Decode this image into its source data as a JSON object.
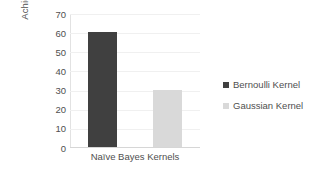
{
  "chart_data": {
    "type": "bar",
    "title": "",
    "subtitle": "",
    "xlabel": "Naïve Bayes Kernels",
    "ylabel_lines": [
      "Maximum Accuracu",
      "Achieved"
    ],
    "ylabel": "Maximum Accuracu Achieved",
    "categories": [
      "Naïve Bayes Kernels"
    ],
    "series": [
      {
        "name": "Bernoulli Kernel",
        "values": [
          60
        ],
        "color": "#404040"
      },
      {
        "name": "Gaussian Kernel",
        "values": [
          30
        ],
        "color": "#d9d9d9"
      }
    ],
    "ylim": [
      0,
      70
    ],
    "ytick_values": [
      70,
      60,
      50,
      40,
      30,
      20,
      10,
      0
    ],
    "ytick_labels": [
      "70",
      "60",
      "50",
      "40",
      "30",
      "20",
      "10",
      "0"
    ],
    "ytick_step": 10,
    "grid": true,
    "grid_axis": "y",
    "legend_position": "right",
    "legend": [
      {
        "label": "Bernoulli Kernel",
        "color": "#404040"
      },
      {
        "label": "Gaussian Kernel",
        "color": "#d9d9d9"
      }
    ],
    "background_color": "#ffffff",
    "text_color": "#4f4f4f",
    "gridline_color": "#f0f0f0",
    "axis_color": "#d6d6d6"
  }
}
